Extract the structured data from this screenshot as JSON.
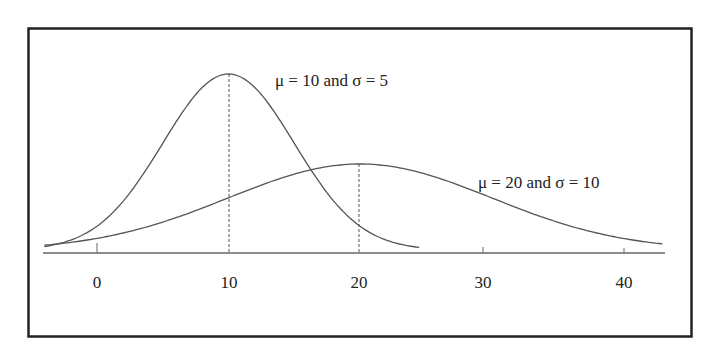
{
  "chart_data": {
    "type": "line",
    "title": "",
    "xlabel": "",
    "ylabel": "",
    "x_ticks": [
      0,
      10,
      20,
      30,
      40
    ],
    "x_tick_labels": [
      "0",
      "10",
      "20",
      "30",
      "40"
    ],
    "xlim": [
      -4,
      43
    ],
    "grid": false,
    "legend": "inline annotations",
    "series": [
      {
        "name": "μ = 10 and σ = 5",
        "distribution": "normal",
        "mean": 10,
        "sd": 5,
        "x_range": [
          -4,
          24.5
        ],
        "mean_marker": "dashed vertical line at x = 10"
      },
      {
        "name": "μ = 20 and σ = 10",
        "distribution": "normal",
        "mean": 20,
        "sd": 10,
        "x_range": [
          -4,
          43
        ],
        "mean_marker": "dashed vertical line at x = 20"
      }
    ],
    "annotations": [
      {
        "text": "μ = 10 and σ = 5",
        "near": "peak of first curve"
      },
      {
        "text": "μ = 20 and σ = 10",
        "near": "right shoulder of second curve"
      }
    ]
  },
  "labels": {
    "curve1": "μ = 10 and σ = 5",
    "curve2": "μ = 20 and σ = 10",
    "ticks": [
      "0",
      "10",
      "20",
      "30",
      "40"
    ]
  },
  "colors": {
    "frame": "#222222",
    "curve": "#555555",
    "axis": "#666666",
    "text": "#222222"
  }
}
